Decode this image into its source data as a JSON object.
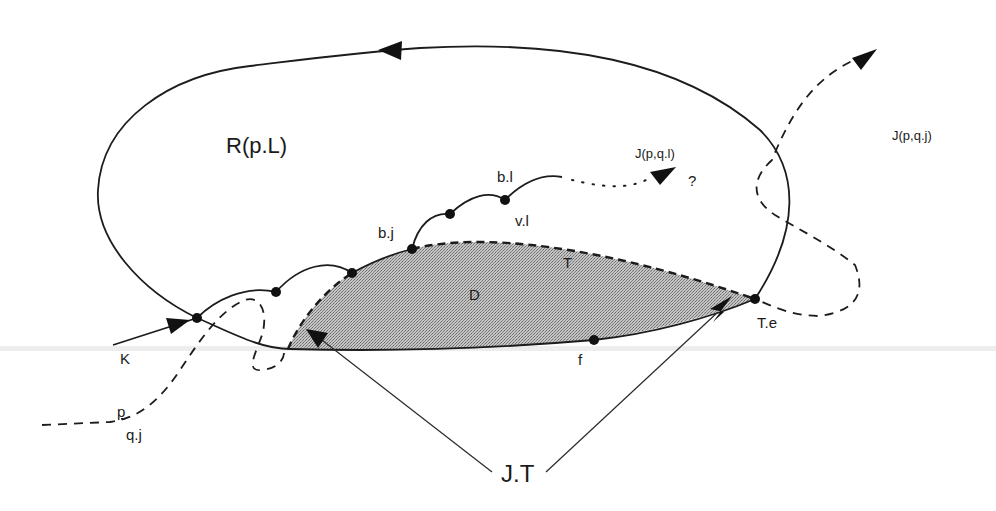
{
  "diagram": {
    "type": "topological-path-diagram",
    "background": "#ffffff",
    "colors": {
      "ink": "#1c1c1c",
      "shaded_region": "#9a9a9a",
      "shade_light": "#c8c8c8"
    },
    "regions": {
      "outer_loop_label": "R(p.L)",
      "shaded_region_label": "D",
      "shaded_boundary_label": "T"
    },
    "points": [
      {
        "name": "entry",
        "label": ""
      },
      {
        "name": "b-j",
        "label": "b.j"
      },
      {
        "name": "b-l",
        "label": "b.l"
      },
      {
        "name": "v-l",
        "label": "v.l"
      },
      {
        "name": "f",
        "label": "f"
      },
      {
        "name": "t-e",
        "label": "T.e"
      }
    ],
    "paths": {
      "k_label": "K",
      "p_label": "p",
      "qj_label": "q.j",
      "jpql_label": "J(p,q.l)",
      "jpql_unknown": "?",
      "jpqj_label": "J(p,q.j)",
      "jt_label": "J.T"
    }
  }
}
